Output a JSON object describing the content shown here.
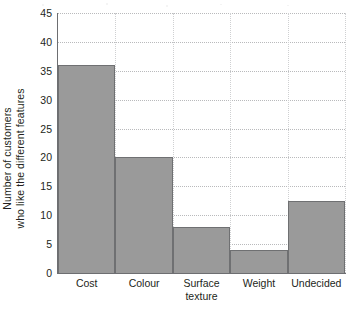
{
  "chart_data": {
    "type": "bar",
    "title": "",
    "subtitle": "",
    "xlabel": "",
    "ylabel": "Number of customers\nwho like the different features",
    "ylabel_lines": [
      "Number of customers",
      "who like the different features"
    ],
    "categories": [
      "Cost",
      "Colour",
      "Surface\ntexture",
      "Weight",
      "Undecided"
    ],
    "category_labels": [
      "Cost",
      "Colour",
      "Surface texture",
      "Weight",
      "Undecided"
    ],
    "values": [
      36,
      20,
      8,
      4,
      12.5
    ],
    "ylim": [
      0,
      45
    ],
    "ytick_step": 5,
    "ytick_labels": [
      "0",
      "5",
      "10",
      "15",
      "20",
      "25",
      "30",
      "35",
      "40",
      "45"
    ],
    "ytick_values": [
      0,
      5,
      10,
      15,
      20,
      25,
      30,
      35,
      40,
      45
    ],
    "grid": "horizontal-dotted-and-vertical-dotted",
    "legend": "none",
    "bar_gap": 0,
    "colors": {
      "bar_fill": "#9a9a9a",
      "bar_border": "#6f7072",
      "axis": "#6d6e71",
      "gridline": "#b9babc",
      "vertical_gridline": "#cfd0d2",
      "text": "#231f20",
      "background": "#ffffff"
    }
  }
}
